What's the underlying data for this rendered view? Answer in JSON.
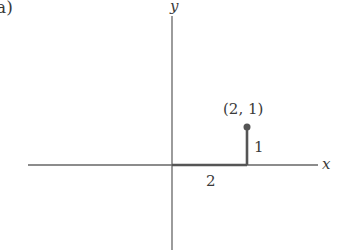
{
  "diagram": {
    "panel_label": "a)",
    "axes": {
      "x_label": "x",
      "y_label": "y"
    },
    "point": {
      "label": "(2, 1)",
      "x": 2,
      "y": 1
    },
    "horizontal_segment_label": "2",
    "vertical_segment_label": "1",
    "colors": {
      "axis": "#555555",
      "segment": "#555555",
      "text": "#3a3a3a"
    }
  }
}
